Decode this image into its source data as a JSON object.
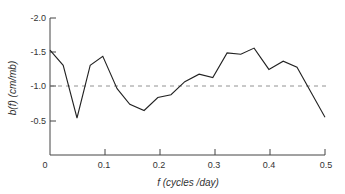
{
  "chart_data": {
    "type": "line",
    "title": "",
    "xlabel": "f (cycles /day)",
    "ylabel": "b(f) (cm/mb)",
    "xlim": [
      0,
      0.5
    ],
    "ylim": [
      0,
      -2.0
    ],
    "y_inverted": true,
    "grid": false,
    "legend": null,
    "x_ticks": [
      0,
      0.1,
      0.2,
      0.3,
      0.4,
      0.5
    ],
    "x_tick_labels": [
      "0",
      "0.1",
      "0.2",
      "0.3",
      "0.4",
      "0.5"
    ],
    "y_ticks": [
      -2.0,
      -1.5,
      -1.0,
      -0.5
    ],
    "y_tick_labels": [
      "-2.0",
      "-1.5",
      "-1.0",
      "-0.5"
    ],
    "reference_line": {
      "y": -1.0,
      "style": "dashed"
    },
    "series": [
      {
        "name": "b(f)",
        "x": [
          0.0,
          0.024,
          0.049,
          0.073,
          0.096,
          0.122,
          0.145,
          0.171,
          0.196,
          0.22,
          0.245,
          0.271,
          0.296,
          0.322,
          0.347,
          0.371,
          0.398,
          0.424,
          0.449,
          0.5
        ],
        "values": [
          -1.53,
          -1.31,
          -0.54,
          -1.31,
          -1.44,
          -0.97,
          -0.74,
          -0.65,
          -0.84,
          -0.88,
          -1.07,
          -1.18,
          -1.13,
          -1.49,
          -1.47,
          -1.56,
          -1.25,
          -1.37,
          -1.28,
          -0.55
        ]
      }
    ]
  },
  "labels": {
    "x_axis_title": "f (cycles /day)",
    "y_axis_title": "b(f) (cm/mb)",
    "x_ticks": [
      "0",
      "0.1",
      "0.2",
      "0.3",
      "0.4",
      "0.5"
    ],
    "y_ticks": [
      "-2.0",
      "-1.5",
      "-1.0",
      "-0.5"
    ]
  }
}
